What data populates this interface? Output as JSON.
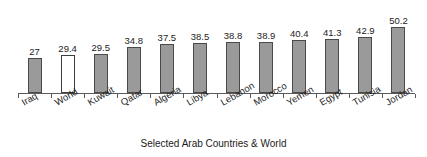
{
  "chart_data": {
    "type": "bar",
    "title": "",
    "xlabel": "Selected Arab Countries & World",
    "ylabel": "",
    "ylim": [
      0,
      65
    ],
    "grid": false,
    "legend": "none",
    "categories": [
      "Iraq",
      "World",
      "Kuwait",
      "Qatar",
      "Algeria",
      "Libya",
      "Lebanon",
      "Morocco",
      "Yemen",
      "Egypt",
      "Tunisia",
      "Jordan"
    ],
    "values": [
      27,
      29.4,
      29.5,
      34.8,
      37.5,
      38.5,
      38.8,
      38.9,
      40.4,
      41.3,
      42.9,
      50.2
    ],
    "value_labels": [
      "27",
      "29.4",
      "29.5",
      "34.8",
      "37.5",
      "38.5",
      "38.8",
      "38.9",
      "40.4",
      "41.3",
      "42.9",
      "50.2"
    ],
    "bar_styles": [
      "filled",
      "hollow",
      "filled",
      "filled",
      "filled",
      "filled",
      "filled",
      "filled",
      "filled",
      "filled",
      "filled",
      "filled"
    ],
    "colors": {
      "bar_fill": "#9a9a9a",
      "bar_border": "#4a4a4a",
      "highlight_fill": "#ffffff",
      "axis": "#5a5a5a",
      "text": "#1c1c1c",
      "background": "#ffffff"
    }
  }
}
